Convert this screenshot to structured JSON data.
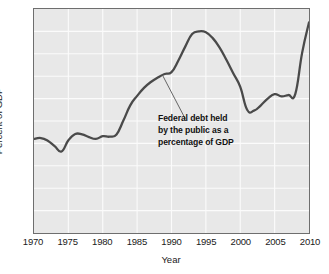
{
  "chart_data": {
    "type": "line",
    "title": "",
    "xlabel": "Year",
    "ylabel": "Percent of GDP",
    "xlim": [
      1970,
      2010
    ],
    "ylim": [
      0,
      50
    ],
    "grid": true,
    "legend": "none",
    "line_color": "#4a4a4a",
    "plot_background": "#e8e8e8",
    "frame_color": "#6e6e6e",
    "gridline_color": "#fbfbfb",
    "xticks": [
      "1970",
      "1975",
      "1980",
      "1985",
      "1990",
      "1995",
      "2000",
      "2005",
      "2010"
    ],
    "xtick_values": [
      1970,
      1975,
      1980,
      1985,
      1990,
      1995,
      2000,
      2005,
      2010
    ],
    "yticks": [
      "0",
      "5",
      "10",
      "15",
      "20",
      "25",
      "30",
      "35",
      "40",
      "45",
      "50"
    ],
    "ytick_values": [
      0,
      5,
      10,
      15,
      20,
      25,
      30,
      35,
      40,
      45,
      50
    ],
    "series": [
      {
        "name": "Federal debt held by the public as a percentage of GDP",
        "x": [
          1970,
          1971,
          1972,
          1973,
          1974,
          1975,
          1976,
          1977,
          1978,
          1979,
          1980,
          1981,
          1982,
          1983,
          1984,
          1985,
          1986,
          1987,
          1988,
          1989,
          1990,
          1991,
          1992,
          1993,
          1994,
          1995,
          1996,
          1997,
          1998,
          1999,
          2000,
          2001,
          2002,
          2003,
          2004,
          2005,
          2006,
          2007,
          2008,
          2009,
          2010
        ],
        "values": [
          21.0,
          21.2,
          20.6,
          19.4,
          18.2,
          20.7,
          22.1,
          22.0,
          21.4,
          21.0,
          21.6,
          21.5,
          22.0,
          25.1,
          28.5,
          30.6,
          32.4,
          33.7,
          34.7,
          35.5,
          35.9,
          38.5,
          41.6,
          44.4,
          45.0,
          44.8,
          43.5,
          41.4,
          38.6,
          35.6,
          32.6,
          27.5,
          27.3,
          28.5,
          30.0,
          31.0,
          30.5,
          30.8,
          31.0,
          40.2,
          47.0
        ]
      }
    ],
    "annotation": {
      "lines": [
        "Federal debt held",
        "by the public as a",
        "percentage of GDP"
      ],
      "leader_from_x": 1988.7,
      "leader_from_y": 35.2,
      "leader_to_x": 1992.0,
      "leader_to_y": 25.5
    }
  }
}
